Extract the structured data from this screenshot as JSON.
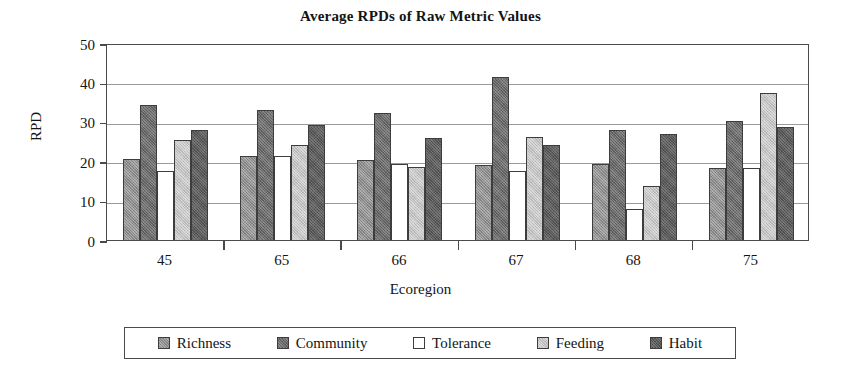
{
  "chart_data": {
    "type": "bar",
    "title": "Average RPDs of Raw Metric Values",
    "xlabel": "Ecoregion",
    "ylabel": "RPD",
    "categories": [
      "45",
      "65",
      "66",
      "67",
      "68",
      "75"
    ],
    "series": [
      {
        "name": "Richness",
        "color": "#8e8e8e",
        "values": [
          20.5,
          21.3,
          20.2,
          19.0,
          19.3,
          18.3
        ]
      },
      {
        "name": "Community",
        "color": "#6a6a6a",
        "values": [
          34.2,
          33.0,
          32.3,
          41.5,
          28.0,
          30.3
        ]
      },
      {
        "name": "Tolerance",
        "color": "#ffffff",
        "values": [
          17.5,
          21.2,
          19.3,
          17.5,
          7.8,
          18.3
        ]
      },
      {
        "name": "Feeding",
        "color": "#c3c3c3",
        "values": [
          25.3,
          24.2,
          18.5,
          26.2,
          13.8,
          37.3
        ]
      },
      {
        "name": "Habit",
        "color": "#5c5c5c",
        "values": [
          28.0,
          29.2,
          25.8,
          24.0,
          27.0,
          28.8
        ]
      }
    ],
    "ylim": [
      0,
      50
    ],
    "yticks": [
      0,
      10,
      20,
      30,
      40,
      50
    ],
    "ytick_labels": [
      "0",
      "10",
      "20",
      "30",
      "40",
      "50"
    ],
    "grid": true,
    "legend_position": "bottom",
    "bar_group_order": [
      "Richness",
      "Community",
      "Tolerance",
      "Feeding",
      "Habit"
    ]
  },
  "legend": {
    "items": [
      {
        "label": "Richness",
        "swatch": "richness-swatch"
      },
      {
        "label": "Community",
        "swatch": "community-swatch"
      },
      {
        "label": "Tolerance",
        "swatch": "tolerance-swatch"
      },
      {
        "label": "Feeding",
        "swatch": "feeding-swatch"
      },
      {
        "label": "Habit",
        "swatch": "habit-swatch"
      }
    ]
  }
}
